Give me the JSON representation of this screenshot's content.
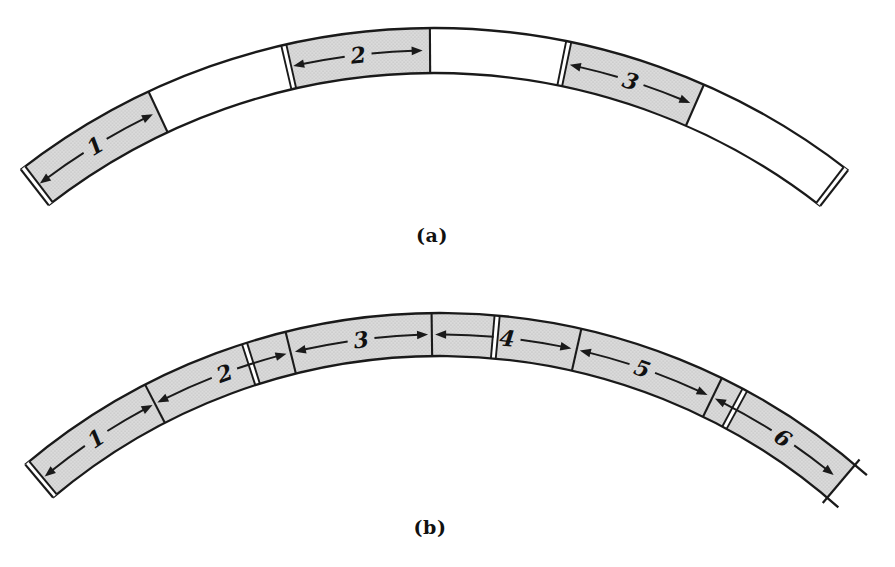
{
  "figure": {
    "background": "#ffffff",
    "line_color": "#1a1a1a",
    "shade_fill": "#dbdbdb",
    "shade_dot": "#a6a6a6",
    "label_color": "#111111",
    "panels": [
      {
        "name": "a",
        "caption": "(a)",
        "caption_pos": {
          "x": 432,
          "y": 235
        },
        "center": {
          "x": 434,
          "y": 701
        },
        "r_outer": 673,
        "r_inner": 628,
        "angle_start": -127.9,
        "angle_end": -52.0,
        "cap_start": {
          "type": "double"
        },
        "cap_end": {
          "type": "double"
        },
        "overhang_end_deg": 0,
        "regions": [
          {
            "from": -127.9,
            "to": -115.1,
            "shaded": true
          },
          {
            "from": -115.1,
            "to": -102.9,
            "shaded": false
          },
          {
            "from": -102.9,
            "to": -90.35,
            "shaded": true
          },
          {
            "from": -90.35,
            "to": -78.45,
            "shaded": false
          },
          {
            "from": -78.45,
            "to": -66.35,
            "shaded": true
          },
          {
            "from": -66.35,
            "to": -52.0,
            "shaded": false
          }
        ],
        "dividers": [
          {
            "angle": -115.1,
            "type": "single"
          },
          {
            "angle": -102.9,
            "type": "double"
          },
          {
            "angle": -90.35,
            "type": "single"
          },
          {
            "angle": -78.45,
            "type": "double"
          },
          {
            "angle": -66.35,
            "type": "single"
          }
        ],
        "arrows": [
          {
            "label": "1",
            "from": -127.3,
            "to": -115.6,
            "label_angle": -121.4
          },
          {
            "label": "2",
            "from": -102.5,
            "to": -91.0,
            "label_angle": -96.7
          },
          {
            "label": "3",
            "from": -77.95,
            "to": -66.8,
            "label_angle": -72.4
          }
        ]
      },
      {
        "name": "b",
        "caption": "(b)",
        "caption_pos": {
          "x": 430,
          "y": 527
        },
        "center": {
          "x": 440,
          "y": 956
        },
        "r_outer": 643,
        "r_inner": 600,
        "angle_start": -130.2,
        "angle_end": -49.8,
        "cap_start": {
          "type": "double"
        },
        "cap_end": {
          "type": "single_overhang"
        },
        "overhang_end_deg": 1.4,
        "regions": [
          {
            "from": -130.2,
            "to": -49.8,
            "shaded": true
          }
        ],
        "dividers": [
          {
            "angle": -117.3,
            "type": "single"
          },
          {
            "angle": -107.7,
            "type": "double"
          },
          {
            "angle": -103.9,
            "type": "single"
          },
          {
            "angle": -90.75,
            "type": "single"
          },
          {
            "angle": -84.9,
            "type": "double"
          },
          {
            "angle": -77.3,
            "type": "single"
          },
          {
            "angle": -64.0,
            "type": "single"
          },
          {
            "angle": -61.7,
            "type": "double"
          }
        ],
        "arrows": [
          {
            "label": "1",
            "from": -129.5,
            "to": -117.55,
            "label_angle": -123.6
          },
          {
            "label": "2",
            "from": -117.05,
            "to": -104.3,
            "label_angle": -110.3
          },
          {
            "label": "3",
            "from": -103.5,
            "to": -91.1,
            "label_angle": -97.3
          },
          {
            "label": "4",
            "from": -90.45,
            "to": -77.8,
            "label_angle": -83.8
          },
          {
            "label": "5",
            "from": -77.0,
            "to": -64.5,
            "label_angle": -71.0
          },
          {
            "label": "6",
            "from": -63.75,
            "to": -50.7,
            "label_angle": -56.5
          }
        ]
      }
    ]
  }
}
